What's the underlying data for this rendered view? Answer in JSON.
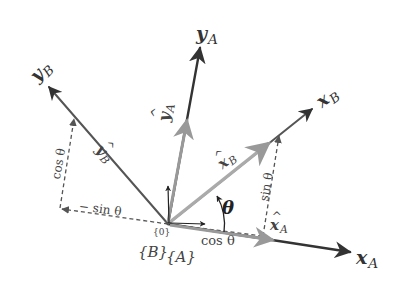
{
  "diagram": {
    "type": "coordinate-frame-rotation",
    "colors": {
      "axis": "#333333",
      "unit_vector": "#888888",
      "dashed": "#555555",
      "text": "#444444",
      "background": "#ffffff"
    },
    "origin": {
      "x": 168,
      "y": 224
    },
    "axes": {
      "x_A": {
        "symbol": "x",
        "subscript": "A",
        "end": {
          "x": 350,
          "y": 253
        }
      },
      "y_A": {
        "symbol": "y",
        "subscript": "A",
        "end": {
          "x": 200,
          "y": 47
        }
      },
      "x_B": {
        "symbol": "x",
        "subscript": "B",
        "end": {
          "x": 313,
          "y": 108
        }
      },
      "y_B": {
        "symbol": "y",
        "subscript": "B",
        "end": {
          "x": 48,
          "y": 86
        }
      }
    },
    "unit_vectors": {
      "x_hat_A": {
        "symbol": "x",
        "subscript": "A"
      },
      "y_hat_A": {
        "symbol": "y",
        "subscript": "A"
      },
      "x_hat_B": {
        "symbol": "x",
        "subscript": "B"
      },
      "y_hat_B": {
        "symbol": "y",
        "subscript": "B"
      }
    },
    "labels": {
      "theta": "θ",
      "cos_theta_xA": "cos θ",
      "sin_theta_xA": "sin θ",
      "cos_theta_yB": "cos θ",
      "neg_sin_theta": "− sin θ",
      "origin_label": "{0}",
      "frame_B": "{B}",
      "frame_A": "{A}"
    }
  }
}
